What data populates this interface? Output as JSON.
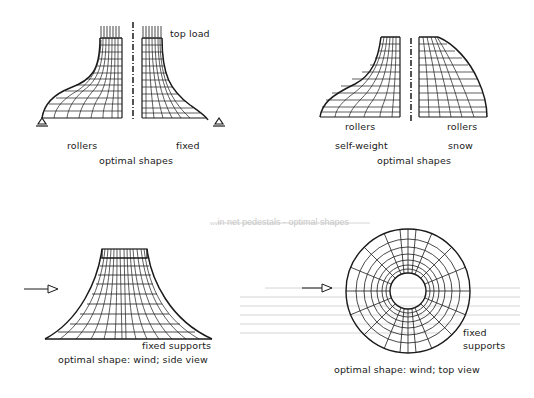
{
  "figure": {
    "panels": [
      {
        "id": "top-load",
        "labels": {
          "load": "top load",
          "left_support": "rollers",
          "right_support": "fixed",
          "caption": "optimal shapes"
        }
      },
      {
        "id": "self-weight-snow",
        "labels": {
          "left_support": "rollers",
          "right_support": "rollers",
          "left_case": "self-weight",
          "right_case": "snow",
          "caption": "optimal shapes"
        }
      },
      {
        "id": "wind-side",
        "labels": {
          "support": "fixed supports",
          "caption": "optimal shape: wind; side view"
        }
      },
      {
        "id": "wind-top",
        "labels": {
          "support_line1": "fixed",
          "support_line2": "supports",
          "caption": "optimal shape: wind; top view"
        }
      }
    ],
    "show_through_text": [
      "...in net pedestals - optimal shapes",
      "The ...",
      "...constraints...",
      "...ta...",
      "...",
      "..."
    ],
    "colors": {
      "ink": "#1a1a1a",
      "ghost": "#c8c8c8",
      "background": "#ffffff"
    }
  }
}
